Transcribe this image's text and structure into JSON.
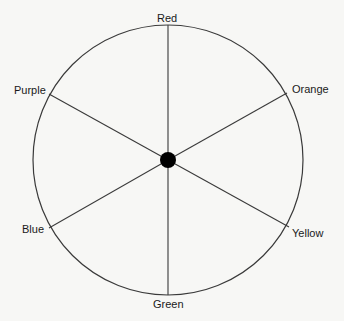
{
  "diagram": {
    "center": {
      "x": 168,
      "y": 160
    },
    "radius": 135,
    "hub_radius": 8,
    "stroke_color": "#3a3a3a",
    "hub_color": "#000000",
    "spokes": [
      {
        "label": "Red",
        "end": {
          "x": 168,
          "y": 25
        },
        "label_pos": {
          "x": 157,
          "y": 12
        }
      },
      {
        "label": "Orange",
        "end": {
          "x": 287,
          "y": 93
        },
        "label_pos": {
          "x": 292,
          "y": 83
        }
      },
      {
        "label": "Yellow",
        "end": {
          "x": 289,
          "y": 227
        },
        "label_pos": {
          "x": 292,
          "y": 227
        }
      },
      {
        "label": "Green",
        "end": {
          "x": 168,
          "y": 295
        },
        "label_pos": {
          "x": 153,
          "y": 298
        }
      },
      {
        "label": "Blue",
        "end": {
          "x": 49,
          "y": 228
        },
        "label_pos": {
          "x": 22,
          "y": 223
        }
      },
      {
        "label": "Purple",
        "end": {
          "x": 49,
          "y": 94
        },
        "label_pos": {
          "x": 14,
          "y": 84
        }
      }
    ]
  }
}
